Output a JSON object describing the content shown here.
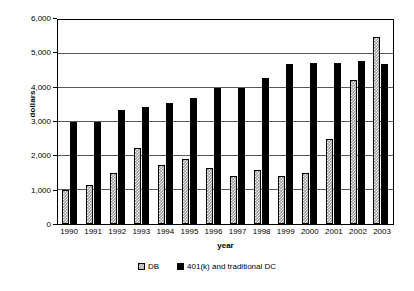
{
  "chart_data": {
    "type": "bar",
    "title": "",
    "xlabel": "year",
    "ylabel": "dollars",
    "ylim": [
      0,
      6000
    ],
    "ytick_values": [
      0,
      1000,
      2000,
      3000,
      4000,
      5000,
      6000
    ],
    "ytick_labels": [
      "0",
      "1,000",
      "2,000",
      "3,000",
      "4,000",
      "5,000",
      "6,000"
    ],
    "grid": true,
    "legend_position": "bottom",
    "categories": [
      "1990",
      "1991",
      "1992",
      "1993",
      "1994",
      "1995",
      "1996",
      "1997",
      "1998",
      "1999",
      "2000",
      "2001",
      "2002",
      "2003"
    ],
    "series": [
      {
        "name": "DB",
        "color": "#9a9a9a",
        "pattern": "checkered",
        "values": [
          1000,
          1150,
          1500,
          2250,
          1750,
          1900,
          1650,
          1400,
          1600,
          1400,
          1500,
          2500,
          4250,
          5500
        ]
      },
      {
        "name": "401(k) and traditional DC",
        "color": "#000000",
        "pattern": "solid",
        "values": [
          3000,
          3000,
          3350,
          3450,
          3550,
          3700,
          4000,
          4000,
          4300,
          4700,
          4750,
          4750,
          4800,
          4700
        ]
      }
    ]
  },
  "legend": {
    "items": [
      {
        "label": "DB"
      },
      {
        "label": "401(k) and traditional DC"
      }
    ]
  }
}
